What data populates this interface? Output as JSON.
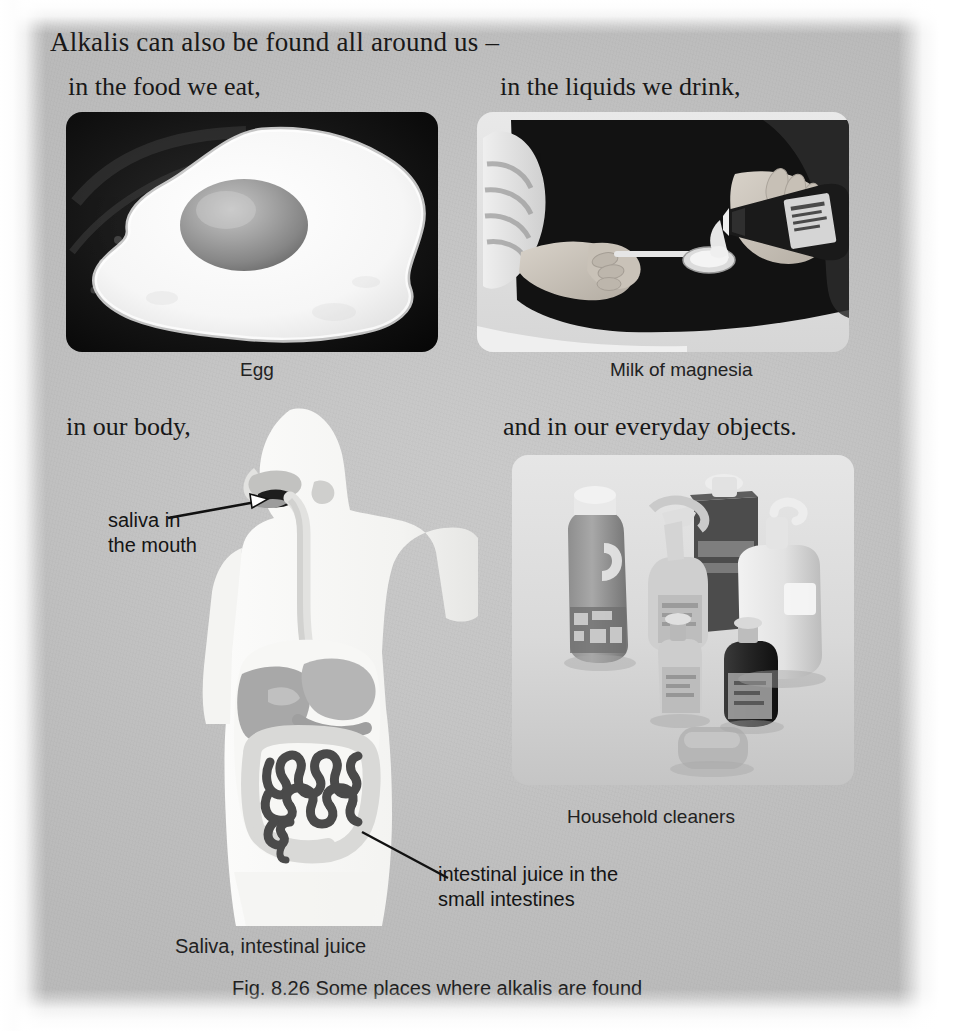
{
  "page": {
    "background_color": "#c4c4c4",
    "paper_edge_color": "#ffffff"
  },
  "text": {
    "intro": "Alkalis can also be found all around us –",
    "food_line": "in the food we eat,",
    "liquids_line": "in the liquids we drink,",
    "body_line": "in our body,",
    "objects_line": "and in our everyday objects."
  },
  "photos": [
    {
      "name": "egg-photo",
      "caption": "Egg",
      "subject": "fried egg in a dark frying pan"
    },
    {
      "name": "milk-of-magnesia-photo",
      "caption": "Milk of magnesia",
      "subject": "person pouring milk of magnesia from a bottle onto a spoon"
    },
    {
      "name": "household-cleaners-photo",
      "caption": "Household cleaners",
      "subject": "assorted cleaning bottles, pump dispensers and a bar of soap"
    }
  ],
  "body_diagram": {
    "caption": "Saliva, intestinal juice",
    "labels": [
      {
        "name": "saliva-label",
        "line1": "saliva in",
        "line2": "the mouth"
      },
      {
        "name": "intestinal-juice-label",
        "line1": "intestinal juice in the",
        "line2": "small intestines"
      }
    ],
    "colors": {
      "silhouette": "#f4f4f2",
      "organs": "#b0b0b0",
      "small_intestine": "#4a4a4a",
      "mouth_highlight": "#1d1d1d"
    }
  },
  "figure": {
    "number": "Fig. 8.26",
    "title": "Some places where alkalis are found",
    "full_caption": "Fig. 8.26  Some places where alkalis are found"
  }
}
